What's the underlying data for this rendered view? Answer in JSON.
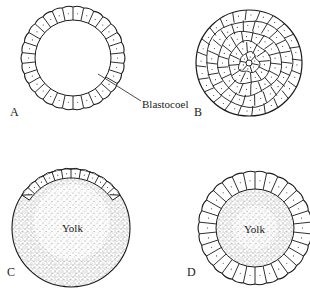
{
  "figure": {
    "panels": [
      {
        "id": "A",
        "letter": "A",
        "description": "Hollow blastula, single ring of cells around blastocoel",
        "cell_count": 30
      },
      {
        "id": "B",
        "letter": "B",
        "description": "Solid ball of cells (stereoblastula)"
      },
      {
        "id": "C",
        "letter": "C",
        "description": "Discoblastula: cap of cells atop large yolk mass"
      },
      {
        "id": "D",
        "letter": "D",
        "description": "Periblastula: ring of cells around central yolk",
        "cell_count": 30
      }
    ],
    "annotations": {
      "blastocoel": "Blastocoel",
      "yolk_c": "Yolk",
      "yolk_d": "Yolk"
    },
    "colors": {
      "line": "#1a1a1a",
      "stipple": "#555555",
      "background": "#ffffff"
    }
  }
}
